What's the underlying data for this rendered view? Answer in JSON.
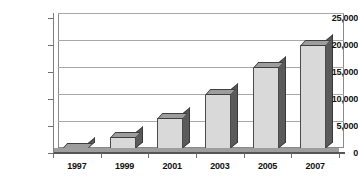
{
  "chart_data": {
    "type": "bar",
    "title": "",
    "subtitle": "",
    "xlabel": "",
    "ylabel": "",
    "categories": [
      "1997",
      "1999",
      "2001",
      "2003",
      "2005",
      "2007"
    ],
    "values": [
      1000,
      3000,
      6500,
      11000,
      16000,
      20000
    ],
    "ylim": [
      0,
      25000
    ],
    "y_ticks": [
      0,
      5000,
      10000,
      15000,
      20000,
      25000
    ],
    "y_tick_labels": [
      "0",
      "5,000",
      "10,000",
      "15,000",
      "20,000",
      "25,000"
    ],
    "grid": true,
    "legend": null,
    "style": "3d-bar",
    "colors": {
      "bar_face": "#d9d9d9",
      "bar_side": "#5a5a5a",
      "bar_top": "#9d9d9d",
      "gridline": "#a8a8a8",
      "axis": "#555555",
      "background": "#ffffff",
      "text": "#111111"
    }
  }
}
